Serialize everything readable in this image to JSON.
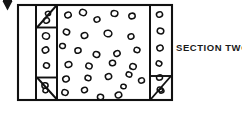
{
  "figure": {
    "type": "technical-line-drawing",
    "title_label": "SECTION TWO",
    "ink_color": "#111111",
    "paper_color": "#ffffff",
    "artifact_marker": "scan-arrow-mark",
    "outer_frame": {
      "x": 18,
      "y": 5,
      "width": 154,
      "height": 95
    },
    "vertical_dividers": [
      36,
      57,
      150
    ],
    "left_blank_column": {
      "x": 18,
      "width": 18
    },
    "left_aggregate_column": {
      "x": 36,
      "width": 21
    },
    "center_aggregate_field": {
      "x": 57,
      "width": 93
    },
    "right_aggregate_column": {
      "x": 150,
      "width": 22
    },
    "corner_triangles": [
      {
        "name": "top-left-triangle",
        "points": "37,6 56,6 37,26"
      },
      {
        "name": "bottom-left-triangle",
        "points": "37,78 56,99 37,99"
      },
      {
        "name": "bottom-right-triangle",
        "points": "171,76 171,99 151,99"
      }
    ],
    "left_column_circles": [
      {
        "cx": 46.5,
        "cy": 20.5,
        "rx": 3.0,
        "ry": 2.6,
        "rot": -18
      },
      {
        "cx": 46.0,
        "cy": 36.0,
        "rx": 3.6,
        "ry": 3.2,
        "rot": 12
      },
      {
        "cx": 45.5,
        "cy": 50.0,
        "rx": 3.3,
        "ry": 2.9,
        "rot": -25
      },
      {
        "cx": 46.5,
        "cy": 65.5,
        "rx": 3.0,
        "ry": 2.7,
        "rot": 20
      },
      {
        "cx": 45.0,
        "cy": 85.5,
        "rx": 3.1,
        "ry": 2.7,
        "rot": -10
      }
    ],
    "right_column_circles": [
      {
        "cx": 159.5,
        "cy": 14.5,
        "rx": 3.1,
        "ry": 2.7,
        "rot": -20
      },
      {
        "cx": 160.5,
        "cy": 31.0,
        "rx": 3.3,
        "ry": 2.9,
        "rot": 10
      },
      {
        "cx": 160.0,
        "cy": 48.0,
        "rx": 3.2,
        "ry": 2.8,
        "rot": -14
      },
      {
        "cx": 159.0,
        "cy": 63.5,
        "rx": 2.9,
        "ry": 2.5,
        "rot": 22
      },
      {
        "cx": 159.5,
        "cy": 77.5,
        "rx": 3.0,
        "ry": 2.6,
        "rot": -8
      },
      {
        "cx": 160.0,
        "cy": 89.5,
        "rx": 2.8,
        "ry": 2.4,
        "rot": 15
      }
    ],
    "center_field_circles": [
      {
        "cx": 68.0,
        "cy": 15.0,
        "rx": 3.3,
        "ry": 2.8,
        "rot": -15
      },
      {
        "cx": 83.0,
        "cy": 12.5,
        "rx": 3.5,
        "ry": 3.0,
        "rot": 18
      },
      {
        "cx": 97.0,
        "cy": 19.5,
        "rx": 3.0,
        "ry": 2.6,
        "rot": -22
      },
      {
        "cx": 114.5,
        "cy": 13.5,
        "rx": 3.4,
        "ry": 2.9,
        "rot": 8
      },
      {
        "cx": 132.0,
        "cy": 16.0,
        "rx": 3.2,
        "ry": 2.8,
        "rot": -12
      },
      {
        "cx": 66.5,
        "cy": 32.0,
        "rx": 3.2,
        "ry": 2.8,
        "rot": 25
      },
      {
        "cx": 84.5,
        "cy": 35.5,
        "rx": 3.3,
        "ry": 2.9,
        "rot": -18
      },
      {
        "cx": 108.0,
        "cy": 33.5,
        "rx": 3.9,
        "ry": 3.3,
        "rot": 10
      },
      {
        "cx": 131.0,
        "cy": 36.5,
        "rx": 3.0,
        "ry": 2.6,
        "rot": -20
      },
      {
        "cx": 62.5,
        "cy": 46.0,
        "rx": 2.9,
        "ry": 2.5,
        "rot": 14
      },
      {
        "cx": 78.0,
        "cy": 50.5,
        "rx": 3.1,
        "ry": 2.7,
        "rot": -10
      },
      {
        "cx": 96.5,
        "cy": 54.5,
        "rx": 3.3,
        "ry": 2.9,
        "rot": 20
      },
      {
        "cx": 117.0,
        "cy": 53.5,
        "rx": 3.2,
        "ry": 2.8,
        "rot": -25
      },
      {
        "cx": 137.0,
        "cy": 50.0,
        "rx": 3.0,
        "ry": 2.6,
        "rot": 12
      },
      {
        "cx": 68.5,
        "cy": 64.5,
        "rx": 3.4,
        "ry": 2.9,
        "rot": -16
      },
      {
        "cx": 89.0,
        "cy": 66.0,
        "rx": 3.2,
        "ry": 2.8,
        "rot": 22
      },
      {
        "cx": 112.5,
        "cy": 63.0,
        "rx": 3.1,
        "ry": 2.7,
        "rot": -8
      },
      {
        "cx": 133.0,
        "cy": 66.5,
        "rx": 3.3,
        "ry": 2.9,
        "rot": 16
      },
      {
        "cx": 66.0,
        "cy": 79.0,
        "rx": 3.3,
        "ry": 2.9,
        "rot": -20
      },
      {
        "cx": 88.0,
        "cy": 78.0,
        "rx": 3.0,
        "ry": 2.6,
        "rot": 10
      },
      {
        "cx": 108.5,
        "cy": 76.5,
        "rx": 3.2,
        "ry": 2.8,
        "rot": -14
      },
      {
        "cx": 129.0,
        "cy": 74.5,
        "rx": 2.9,
        "ry": 2.5,
        "rot": 18
      },
      {
        "cx": 141.5,
        "cy": 80.5,
        "rx": 3.0,
        "ry": 2.6,
        "rot": -12
      },
      {
        "cx": 65.0,
        "cy": 92.5,
        "rx": 3.2,
        "ry": 2.8,
        "rot": 20
      },
      {
        "cx": 84.5,
        "cy": 90.0,
        "rx": 3.0,
        "ry": 2.6,
        "rot": -18
      },
      {
        "cx": 100.5,
        "cy": 97.0,
        "rx": 3.1,
        "ry": 2.7,
        "rot": 8
      },
      {
        "cx": 118.5,
        "cy": 95.0,
        "rx": 3.3,
        "ry": 2.9,
        "rot": -22
      },
      {
        "cx": 123.5,
        "cy": 86.5,
        "rx": 2.7,
        "ry": 2.3,
        "rot": 12
      }
    ],
    "triangle_circles": [
      {
        "cx": 48.0,
        "cy": 13.5,
        "rx": 2.6,
        "ry": 2.2,
        "rot": -15
      },
      {
        "cx": 45.5,
        "cy": 90.5,
        "rx": 2.6,
        "ry": 2.2,
        "rot": 10
      },
      {
        "cx": 161.5,
        "cy": 91.0,
        "rx": 2.5,
        "ry": 2.1,
        "rot": -12
      }
    ]
  }
}
